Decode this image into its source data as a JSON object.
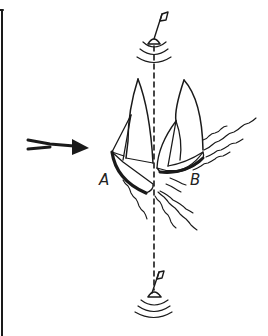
{
  "figure": {
    "labels": {
      "boat_a": "A",
      "boat_b": "B"
    },
    "colors": {
      "ink": "#1a1a1a",
      "background": "#ffffff"
    }
  }
}
